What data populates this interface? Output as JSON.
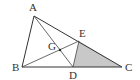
{
  "figure": {
    "type": "geometry-diagram",
    "points": {
      "A": {
        "label": "A",
        "x": 34,
        "y": 16,
        "lx": 29,
        "ly": 11
      },
      "B": {
        "label": "B",
        "x": 22,
        "y": 67,
        "lx": 12,
        "ly": 71
      },
      "C": {
        "label": "C",
        "x": 122,
        "y": 67,
        "lx": 125,
        "ly": 71
      },
      "D": {
        "label": "D",
        "x": 73,
        "y": 67,
        "lx": 69,
        "ly": 79
      },
      "E": {
        "label": "E",
        "x": 79,
        "y": 41,
        "lx": 79,
        "ly": 37
      },
      "G": {
        "label": "G",
        "x": 60,
        "y": 50,
        "lx": 48,
        "ly": 50
      }
    },
    "segments": [
      "AB",
      "BC",
      "CA",
      "AD",
      "BE",
      "DE"
    ],
    "shaded_region": {
      "vertices": [
        "D",
        "E",
        "C"
      ],
      "color": "#c8c8c8"
    },
    "line_color": "#333333"
  }
}
